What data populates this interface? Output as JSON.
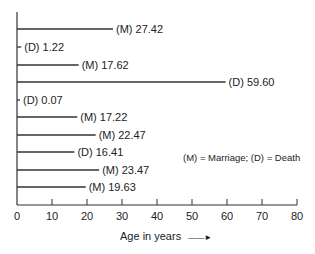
{
  "chart_data": {
    "type": "bar",
    "orientation": "horizontal",
    "title": "",
    "xlabel": "Age in years",
    "ylabel": "",
    "xlim": [
      0,
      80
    ],
    "xticks": [
      0,
      10,
      20,
      30,
      40,
      50,
      60,
      70,
      80
    ],
    "grid": false,
    "legend_text": "(M) = Marriage; (D) = Death",
    "bars": [
      {
        "type": "M",
        "value": 27.42,
        "label": "(M) 27.42"
      },
      {
        "type": "D",
        "value": 1.22,
        "label": "(D) 1.22"
      },
      {
        "type": "M",
        "value": 17.62,
        "label": "(M) 17.62"
      },
      {
        "type": "D",
        "value": 59.6,
        "label": "(D) 59.60"
      },
      {
        "type": "D",
        "value": 0.07,
        "label": "(D) 0.07"
      },
      {
        "type": "M",
        "value": 17.22,
        "label": "(M) 17.22"
      },
      {
        "type": "M",
        "value": 22.47,
        "label": "(M) 22.47"
      },
      {
        "type": "D",
        "value": 16.41,
        "label": "(D) 16.41"
      },
      {
        "type": "M",
        "value": 23.47,
        "label": "(M) 23.47"
      },
      {
        "type": "M",
        "value": 19.63,
        "label": "(M) 19.63"
      }
    ]
  },
  "labels": {
    "xlabel": "Age in years",
    "arrow": "——►",
    "legend": "(M) = Marriage; (D) = Death"
  }
}
